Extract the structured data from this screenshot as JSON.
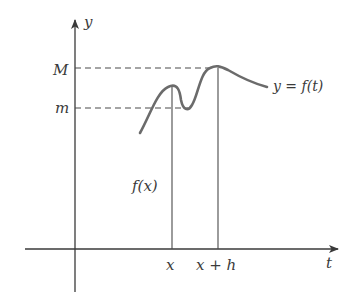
{
  "figure": {
    "type": "function-graph-diagram",
    "colors": {
      "axis": "#3a3a3a",
      "curve": "#6b6b6b",
      "dashed": "#4a4a4a",
      "text": "#3a3a3a"
    },
    "axes": {
      "y_label": "y",
      "x_label": "t"
    },
    "levels": {
      "upper_label": "M",
      "lower_label": "m"
    },
    "ticks": {
      "x_label": "x",
      "x_plus_h_label": "x + h"
    },
    "curve_label": "y = f(t)",
    "height_label": "f(x)"
  }
}
